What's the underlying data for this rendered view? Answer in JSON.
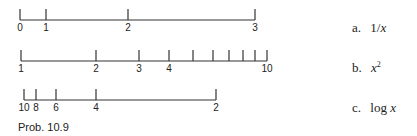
{
  "figure": {
    "caption": "Prob. 10.9",
    "scales": [
      {
        "id": "a",
        "label_prefix": "a.",
        "function_text": "1/",
        "function_var": "x",
        "baseline_y": 20,
        "x_start": 20,
        "x_end": 255,
        "ticks": [
          {
            "value": "0",
            "x": 20,
            "labeled": true
          },
          {
            "value": "1",
            "x": 46,
            "labeled": true
          },
          {
            "value": "2",
            "x": 128,
            "labeled": true
          },
          {
            "value": "3",
            "x": 255,
            "labeled": true
          }
        ]
      },
      {
        "id": "b",
        "label_prefix": "b.",
        "function_var": "x",
        "function_sup": "2",
        "baseline_y": 61,
        "x_start": 21,
        "x_end": 267,
        "ticks": [
          {
            "value": "1",
            "x": 21,
            "labeled": true
          },
          {
            "value": "2",
            "x": 96,
            "labeled": true
          },
          {
            "value": "3",
            "x": 139,
            "labeled": true
          },
          {
            "value": "4",
            "x": 169,
            "labeled": true
          },
          {
            "value": "5",
            "x": 193,
            "labeled": false
          },
          {
            "value": "6",
            "x": 213,
            "labeled": false
          },
          {
            "value": "7",
            "x": 229,
            "labeled": false
          },
          {
            "value": "8",
            "x": 243,
            "labeled": false
          },
          {
            "value": "9",
            "x": 255,
            "labeled": false
          },
          {
            "value": "10",
            "x": 267,
            "labeled": true
          }
        ]
      },
      {
        "id": "c",
        "label_prefix": "c.",
        "function_text": "log ",
        "function_var": "x",
        "baseline_y": 100,
        "x_start": 24,
        "x_end": 216,
        "ticks": [
          {
            "value": "10",
            "x": 24,
            "labeled": true
          },
          {
            "value": "8",
            "x": 36,
            "labeled": true
          },
          {
            "value": "6",
            "x": 56,
            "labeled": true
          },
          {
            "value": "4",
            "x": 96,
            "labeled": true
          },
          {
            "value": "2",
            "x": 216,
            "labeled": true
          }
        ]
      }
    ]
  }
}
